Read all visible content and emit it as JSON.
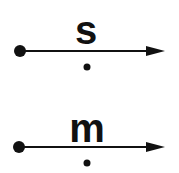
{
  "diagrams": [
    {
      "label": "s",
      "color": "#111111"
    },
    {
      "label": "m",
      "color": "#111111"
    }
  ]
}
